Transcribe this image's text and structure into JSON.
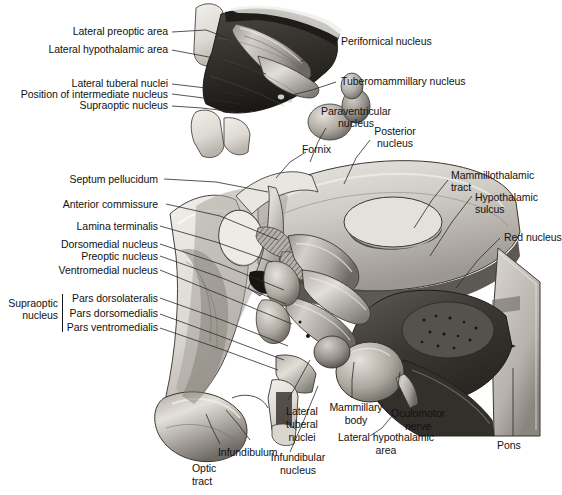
{
  "figure": {
    "style": "grayscale medical line-and-tone drawing",
    "width": 562,
    "height": 495,
    "background_color": "#ffffff",
    "text_color": "#121212",
    "leader_line_color": "#2b2b2b"
  },
  "labels": {
    "lateral_preoptic_area": "Lateral preoptic area",
    "lateral_hypothalamic_area_top": "Lateral hypothalamic area",
    "lateral_tuberal_nuclei_top": "Lateral tuberal nuclei",
    "position_of_intermediate_nucleus": "Position of intermediate nucleus",
    "supraoptic_nucleus_top": "Supraoptic nucleus",
    "perifornical_nucleus": "Perifornical nucleus",
    "tuberomammillary_nucleus": "Tuberomammillary nucleus",
    "paraventricular_nucleus_line1": "Paraventricular",
    "paraventricular_nucleus_line2": "nucleus",
    "posterior_nucleus_line1": "Posterior",
    "posterior_nucleus_line2": "nucleus",
    "fornix": "Fornix",
    "septum_pellucidum": "Septum pellucidum",
    "anterior_commissure": "Anterior commissure",
    "lamina_terminalis": "Lamina terminalis",
    "dorsomedial_nucleus": "Dorsomedial nucleus",
    "preoptic_nucleus": "Preoptic nucleus",
    "ventromedial_nucleus": "Ventromedial nucleus",
    "supraoptic_group_line1": "Supraoptic",
    "supraoptic_group_line2": "nucleus",
    "pars_dorsolateralis": "Pars dorsolateralis",
    "pars_dorsomedialis": "Pars dorsomedialis",
    "pars_ventromedialis": "Pars ventromedialis",
    "mammillothalamic_tract_line1": "Mammillothalamic",
    "mammillothalamic_tract_line2": "tract",
    "hypothalamic_sulcus_line1": "Hypothalamic",
    "hypothalamic_sulcus_line2": "sulcus",
    "red_nucleus": "Red nucleus",
    "lateral_tuberal_nuclei_line1": "Lateral",
    "lateral_tuberal_nuclei_line2": "tuberal",
    "lateral_tuberal_nuclei_line3": "nuclei",
    "mammillary_body_line1": "Mammillary",
    "mammillary_body_line2": "body",
    "oculomotor_nerve_line1": "Oculomotor",
    "oculomotor_nerve_line2": "nerve",
    "lateral_hypothalamic_area_line1": "Lateral hypothalamic",
    "lateral_hypothalamic_area_line2": "area",
    "pons": "Pons",
    "infundibulum": "Infundibulum",
    "infundibular_nucleus_line1": "Infundibular",
    "infundibular_nucleus_line2": "nucleus",
    "optic_tract_line1": "Optic",
    "optic_tract_line2": "tract"
  }
}
